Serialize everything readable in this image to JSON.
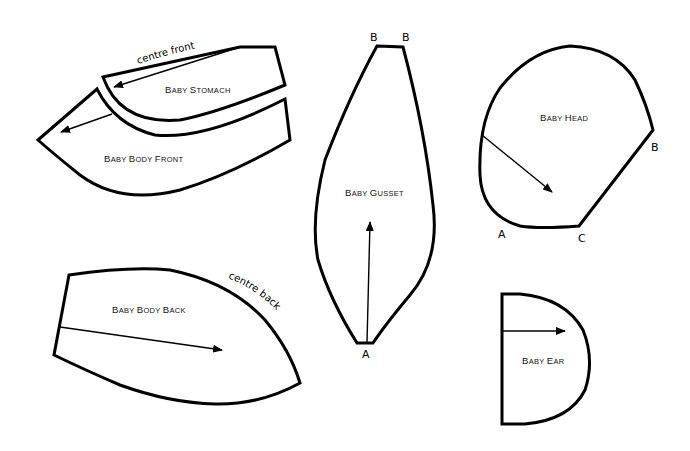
{
  "colors": {
    "outline": "#000000",
    "background": "#ffffff"
  },
  "pieces": {
    "stomach": {
      "name_first": "B",
      "name_rest": "ABY ",
      "name2_first": "S",
      "name2_rest": "TOMACH",
      "edge_note": "centre front"
    },
    "body_front": {
      "name_first": "B",
      "name_rest": "ABY ",
      "name2_first": "B",
      "name2_rest": "ODY ",
      "name3_first": "F",
      "name3_rest": "RONT"
    },
    "gusset": {
      "name_first": "B",
      "name_rest": "ABY ",
      "name2_first": "G",
      "name2_rest": "USSET",
      "point_top_left": "B",
      "point_top_right": "B",
      "point_bottom": "A"
    },
    "head": {
      "name_first": "B",
      "name_rest": "ABY ",
      "name2_first": "H",
      "name2_rest": "EAD",
      "point_a": "A",
      "point_b": "B",
      "point_c": "C"
    },
    "body_back": {
      "name_first": "B",
      "name_rest": "ABY ",
      "name2_first": "B",
      "name2_rest": "ODY ",
      "name3_first": "B",
      "name3_rest": "ACK",
      "edge_note": "centre back"
    },
    "ear": {
      "name_first": "B",
      "name_rest": "ABY ",
      "name2_first": "E",
      "name2_rest": "AR"
    }
  }
}
